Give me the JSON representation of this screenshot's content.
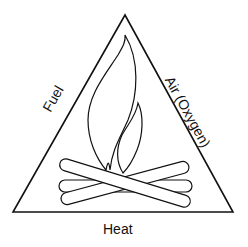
{
  "diagram": {
    "sides": {
      "left": "Fuel",
      "right": "Air (Oxygen)",
      "bottom": "Heat"
    },
    "center_illustration": "campfire-flame-with-logs",
    "colors": {
      "stroke": "#111111",
      "background": "#ffffff"
    }
  }
}
